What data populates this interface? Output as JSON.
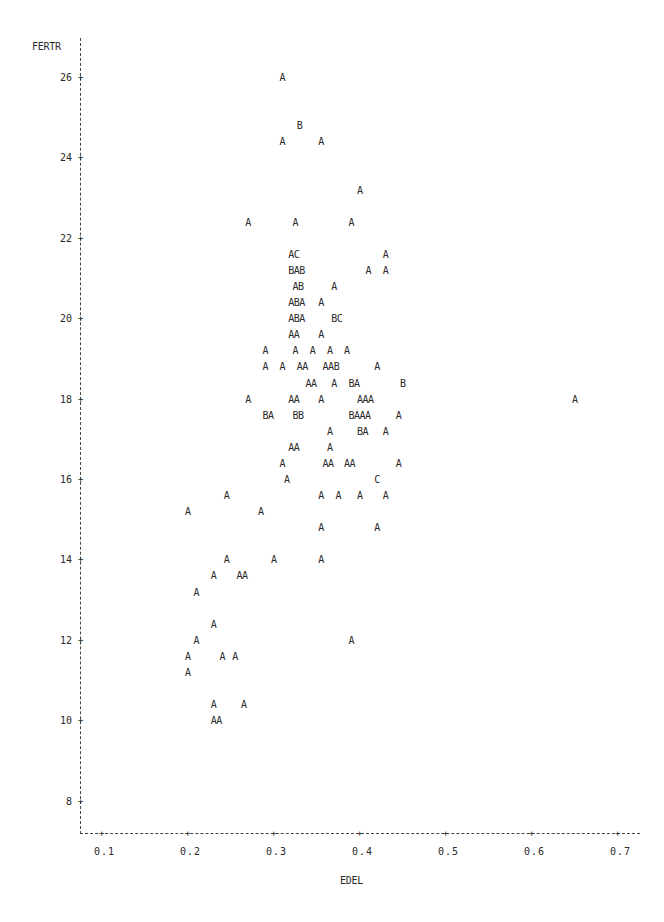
{
  "chart_data": {
    "type": "scatter",
    "title": "",
    "xlabel": "EDEL",
    "ylabel": "FERTR",
    "xlim": [
      0.075,
      0.72
    ],
    "ylim": [
      7.2,
      26.8
    ],
    "grid": false,
    "legend": "none (plot symbols: A = 1 obs, B = 2 obs, C = 3 obs)",
    "x_ticks": [
      "0.1",
      "0.2",
      "0.3",
      "0.4",
      "0.5",
      "0.6",
      "0.7"
    ],
    "y_ticks": [
      "8",
      "10",
      "12",
      "14",
      "16",
      "18",
      "20",
      "22",
      "24",
      "26"
    ],
    "points": [
      {
        "x": 0.31,
        "y": 26.0,
        "sym": "A"
      },
      {
        "x": 0.33,
        "y": 24.8,
        "sym": "B"
      },
      {
        "x": 0.31,
        "y": 24.4,
        "sym": "A"
      },
      {
        "x": 0.355,
        "y": 24.4,
        "sym": "A"
      },
      {
        "x": 0.4,
        "y": 23.2,
        "sym": "A"
      },
      {
        "x": 0.27,
        "y": 22.4,
        "sym": "A"
      },
      {
        "x": 0.325,
        "y": 22.4,
        "sym": "A"
      },
      {
        "x": 0.39,
        "y": 22.4,
        "sym": "A"
      },
      {
        "x": 0.32,
        "y": 21.6,
        "sym": "AC"
      },
      {
        "x": 0.43,
        "y": 21.6,
        "sym": "A"
      },
      {
        "x": 0.32,
        "y": 21.2,
        "sym": "BAB"
      },
      {
        "x": 0.41,
        "y": 21.2,
        "sym": "A"
      },
      {
        "x": 0.43,
        "y": 21.2,
        "sym": "A"
      },
      {
        "x": 0.325,
        "y": 20.8,
        "sym": "AB"
      },
      {
        "x": 0.37,
        "y": 20.8,
        "sym": "A"
      },
      {
        "x": 0.32,
        "y": 20.4,
        "sym": "ABA"
      },
      {
        "x": 0.355,
        "y": 20.4,
        "sym": "A"
      },
      {
        "x": 0.32,
        "y": 20.0,
        "sym": "ABA"
      },
      {
        "x": 0.37,
        "y": 20.0,
        "sym": "BC"
      },
      {
        "x": 0.32,
        "y": 19.6,
        "sym": "AA"
      },
      {
        "x": 0.355,
        "y": 19.6,
        "sym": "A"
      },
      {
        "x": 0.29,
        "y": 19.2,
        "sym": "A"
      },
      {
        "x": 0.325,
        "y": 19.2,
        "sym": "A"
      },
      {
        "x": 0.345,
        "y": 19.2,
        "sym": "A"
      },
      {
        "x": 0.365,
        "y": 19.2,
        "sym": "A"
      },
      {
        "x": 0.385,
        "y": 19.2,
        "sym": "A"
      },
      {
        "x": 0.29,
        "y": 18.8,
        "sym": "A"
      },
      {
        "x": 0.31,
        "y": 18.8,
        "sym": "A"
      },
      {
        "x": 0.33,
        "y": 18.8,
        "sym": "AA"
      },
      {
        "x": 0.36,
        "y": 18.8,
        "sym": "AAB"
      },
      {
        "x": 0.42,
        "y": 18.8,
        "sym": "A"
      },
      {
        "x": 0.34,
        "y": 18.4,
        "sym": "AA"
      },
      {
        "x": 0.37,
        "y": 18.4,
        "sym": "A"
      },
      {
        "x": 0.39,
        "y": 18.4,
        "sym": "BA"
      },
      {
        "x": 0.45,
        "y": 18.4,
        "sym": "B"
      },
      {
        "x": 0.27,
        "y": 18.0,
        "sym": "A"
      },
      {
        "x": 0.32,
        "y": 18.0,
        "sym": "AA"
      },
      {
        "x": 0.355,
        "y": 18.0,
        "sym": "A"
      },
      {
        "x": 0.4,
        "y": 18.0,
        "sym": "AAA"
      },
      {
        "x": 0.65,
        "y": 18.0,
        "sym": "A"
      },
      {
        "x": 0.29,
        "y": 17.6,
        "sym": "BA"
      },
      {
        "x": 0.325,
        "y": 17.6,
        "sym": "BB"
      },
      {
        "x": 0.39,
        "y": 17.6,
        "sym": "BAAA"
      },
      {
        "x": 0.445,
        "y": 17.6,
        "sym": "A"
      },
      {
        "x": 0.365,
        "y": 17.2,
        "sym": "A"
      },
      {
        "x": 0.4,
        "y": 17.2,
        "sym": "BA"
      },
      {
        "x": 0.43,
        "y": 17.2,
        "sym": "A"
      },
      {
        "x": 0.32,
        "y": 16.8,
        "sym": "AA"
      },
      {
        "x": 0.365,
        "y": 16.8,
        "sym": "A"
      },
      {
        "x": 0.31,
        "y": 16.4,
        "sym": "A"
      },
      {
        "x": 0.36,
        "y": 16.4,
        "sym": "AA"
      },
      {
        "x": 0.385,
        "y": 16.4,
        "sym": "AA"
      },
      {
        "x": 0.445,
        "y": 16.4,
        "sym": "A"
      },
      {
        "x": 0.315,
        "y": 16.0,
        "sym": "A"
      },
      {
        "x": 0.42,
        "y": 16.0,
        "sym": "C"
      },
      {
        "x": 0.245,
        "y": 15.6,
        "sym": "A"
      },
      {
        "x": 0.355,
        "y": 15.6,
        "sym": "A"
      },
      {
        "x": 0.375,
        "y": 15.6,
        "sym": "A"
      },
      {
        "x": 0.4,
        "y": 15.6,
        "sym": "A"
      },
      {
        "x": 0.43,
        "y": 15.6,
        "sym": "A"
      },
      {
        "x": 0.2,
        "y": 15.2,
        "sym": "A"
      },
      {
        "x": 0.285,
        "y": 15.2,
        "sym": "A"
      },
      {
        "x": 0.355,
        "y": 14.8,
        "sym": "A"
      },
      {
        "x": 0.42,
        "y": 14.8,
        "sym": "A"
      },
      {
        "x": 0.245,
        "y": 14.0,
        "sym": "A"
      },
      {
        "x": 0.3,
        "y": 14.0,
        "sym": "A"
      },
      {
        "x": 0.355,
        "y": 14.0,
        "sym": "A"
      },
      {
        "x": 0.23,
        "y": 13.6,
        "sym": "A"
      },
      {
        "x": 0.26,
        "y": 13.6,
        "sym": "AA"
      },
      {
        "x": 0.21,
        "y": 13.2,
        "sym": "A"
      },
      {
        "x": 0.23,
        "y": 12.4,
        "sym": "A"
      },
      {
        "x": 0.21,
        "y": 12.0,
        "sym": "A"
      },
      {
        "x": 0.39,
        "y": 12.0,
        "sym": "A"
      },
      {
        "x": 0.2,
        "y": 11.6,
        "sym": "A"
      },
      {
        "x": 0.24,
        "y": 11.6,
        "sym": "A"
      },
      {
        "x": 0.255,
        "y": 11.6,
        "sym": "A"
      },
      {
        "x": 0.2,
        "y": 11.2,
        "sym": "A"
      },
      {
        "x": 0.23,
        "y": 10.4,
        "sym": "A"
      },
      {
        "x": 0.265,
        "y": 10.4,
        "sym": "A"
      },
      {
        "x": 0.23,
        "y": 10.0,
        "sym": "AA"
      }
    ]
  },
  "plot_geometry": {
    "x_px_origin": 102,
    "x_px_per_unit": 860,
    "x_unit_origin": 0.1,
    "y_px_origin": 78,
    "y_px_per_unit": 40.2,
    "y_unit_origin": 26
  }
}
